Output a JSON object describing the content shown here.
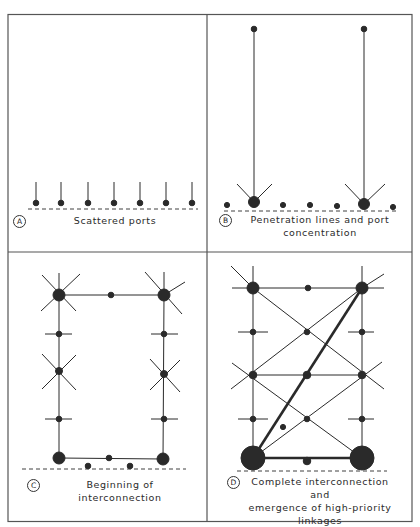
{
  "figure": {
    "panels": [
      {
        "id": "A",
        "badge": "A",
        "caption_lines": [
          "Scattered ports"
        ]
      },
      {
        "id": "B",
        "badge": "B",
        "caption_lines": [
          "Penetration lines and port",
          "concentration"
        ]
      },
      {
        "id": "C",
        "badge": "C",
        "caption_lines": [
          "Beginning of interconnection"
        ]
      },
      {
        "id": "D",
        "badge": "D",
        "caption_lines": [
          "Complete interconnection and",
          "emergence of high-priority",
          "linkages"
        ]
      }
    ],
    "colors": {
      "ink": "#2a2a2a",
      "background": "#ffffff",
      "border": "#555555"
    }
  }
}
